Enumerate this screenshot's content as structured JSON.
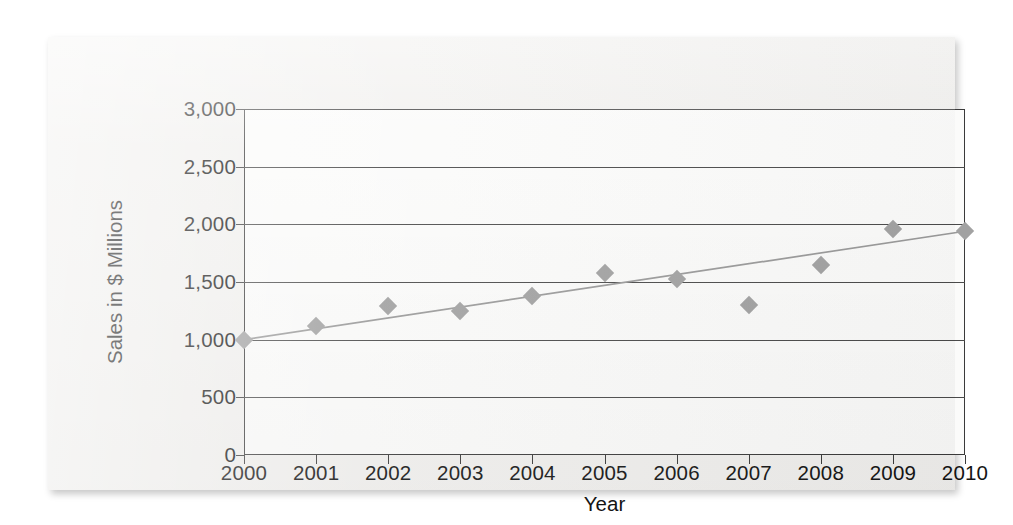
{
  "chart_data": {
    "type": "scatter",
    "title": "",
    "xlabel": "Year",
    "ylabel": "Sales in $ Millions",
    "grid": true,
    "legend": "none",
    "xlim": [
      2000,
      2010
    ],
    "ylim": [
      0,
      3000
    ],
    "x_tick_labels": [
      "2000",
      "2001",
      "2002",
      "2003",
      "2004",
      "2005",
      "2006",
      "2007",
      "2008",
      "2009",
      "2010"
    ],
    "y_tick_labels": [
      "0",
      "500",
      "1,000",
      "1,500",
      "2,000",
      "2,500",
      "3,000"
    ],
    "y_ticks": [
      0,
      500,
      1000,
      1500,
      2000,
      2500,
      3000
    ],
    "x": [
      2000,
      2001,
      2002,
      2003,
      2004,
      2005,
      2006,
      2007,
      2008,
      2009,
      2010
    ],
    "values": [
      1000,
      1120,
      1295,
      1250,
      1380,
      1575,
      1525,
      1300,
      1650,
      1960,
      1940
    ],
    "series": [
      {
        "name": "Sales",
        "marker": "diamond",
        "color": "#a2a2a2",
        "values": [
          1000,
          1120,
          1295,
          1250,
          1380,
          1575,
          1525,
          1300,
          1650,
          1960,
          1940
        ]
      },
      {
        "name": "Linear trendline",
        "type": "line",
        "color": "#9a9a9a",
        "endpoints": [
          {
            "x": 2000,
            "y": 1000
          },
          {
            "x": 2010,
            "y": 1940
          }
        ]
      }
    ]
  },
  "colors": {
    "marker": "#a2a2a2",
    "trendline": "#9a9a9a",
    "gridline": "#4a4a4a",
    "axis": "#3a3a3a",
    "text": "#141414",
    "page": "#f1f0ee",
    "background": "#ffffff"
  }
}
